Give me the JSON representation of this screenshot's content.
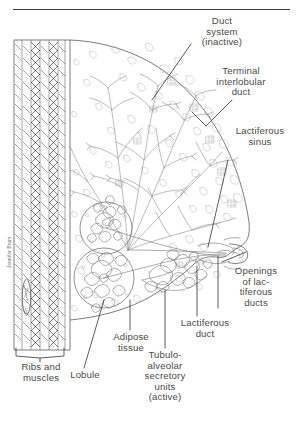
{
  "figure": {
    "title_rule": "horizontal-rule",
    "artist_signature": "Jennifer Brum"
  },
  "labels": {
    "duct_system": "Duct\nsystem\n(inactive)",
    "terminal_interlobular_duct": "Terminal\ninterlobular\nduct",
    "lactiferous_sinus": "Lactiferous\nsinus",
    "openings_lactiferous_ducts": "Openings\nof lac-\ntiferous\nducts",
    "lactiferous_duct": "Lactiferous\nduct",
    "tubuloalveolar_units": "Tubulo-\nalveolar\nsecretory\nunits\n(active)",
    "adipose_tissue": "Adipose\ntissue",
    "lobule": "Lobule",
    "ribs_and_muscles": "Ribs and\nmuscles"
  },
  "colors": {
    "ink": "#777777",
    "ink_dark": "#3d3d3d",
    "text": "#4a4a4a",
    "background": "#ffffff",
    "muscle_hatch": "#2e2e2e"
  }
}
